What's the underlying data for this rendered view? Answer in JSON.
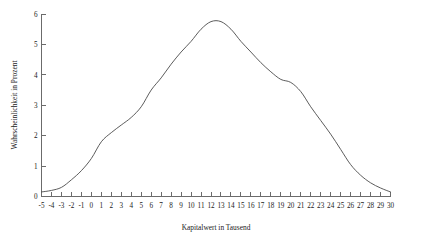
{
  "chart_data": {
    "type": "line",
    "title": "",
    "xlabel": "Kapitalwert in Tausend",
    "ylabel": "Wahrscheinlichkeit in Prozent",
    "xlim": [
      -5,
      30
    ],
    "ylim": [
      0,
      6
    ],
    "grid": false,
    "legend": null,
    "line_color": "#4a4a4a",
    "axis_color": "#6b6b6b",
    "background_color": "#ffffff",
    "x_tick_labels": [
      "-5",
      "-4",
      "-3",
      "-2",
      "-1",
      "0",
      "1",
      "2",
      "3",
      "4",
      "5",
      "6",
      "7",
      "8",
      "9",
      "10",
      "11",
      "12",
      "13",
      "14",
      "15",
      "16",
      "17",
      "18",
      "19",
      "20",
      "21",
      "22",
      "23",
      "24",
      "25",
      "26",
      "27",
      "28",
      "29",
      "30"
    ],
    "y_tick_labels": [
      "0",
      "1",
      "2",
      "3",
      "4",
      "5",
      "6"
    ],
    "x": [
      -5,
      -4,
      -3,
      -2,
      -1,
      0,
      1,
      2,
      3,
      4,
      5,
      6,
      7,
      8,
      9,
      10,
      11,
      12,
      13,
      14,
      15,
      16,
      17,
      18,
      19,
      20,
      21,
      22,
      23,
      24,
      25,
      26,
      27,
      28,
      29,
      30
    ],
    "values": [
      0.15,
      0.2,
      0.3,
      0.55,
      0.85,
      1.25,
      1.8,
      2.1,
      2.35,
      2.6,
      2.95,
      3.5,
      3.9,
      4.35,
      4.75,
      5.1,
      5.5,
      5.75,
      5.75,
      5.5,
      5.1,
      4.75,
      4.4,
      4.1,
      3.85,
      3.75,
      3.45,
      2.95,
      2.5,
      2.05,
      1.55,
      1.05,
      0.7,
      0.45,
      0.28,
      0.15
    ],
    "series": [
      {
        "name": "Wahrscheinlichkeitsverteilung",
        "values": [
          0.15,
          0.2,
          0.3,
          0.55,
          0.85,
          1.25,
          1.8,
          2.1,
          2.35,
          2.6,
          2.95,
          3.5,
          3.9,
          4.35,
          4.75,
          5.1,
          5.5,
          5.75,
          5.75,
          5.5,
          5.1,
          4.75,
          4.4,
          4.1,
          3.85,
          3.75,
          3.45,
          2.95,
          2.5,
          2.05,
          1.55,
          1.05,
          0.7,
          0.45,
          0.28,
          0.15
        ]
      }
    ]
  }
}
